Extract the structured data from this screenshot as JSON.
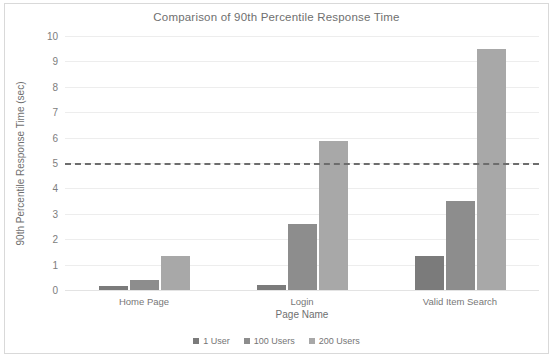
{
  "chart_data": {
    "type": "bar",
    "title": "Comparison of 90th Percentile Response Time",
    "xlabel": "Page Name",
    "ylabel": "90th Percentile Response Time (sec)",
    "categories": [
      "Home Page",
      "Login",
      "Valid Item Search"
    ],
    "series": [
      {
        "name": "1 User",
        "color": "#7b7b7b",
        "values": [
          0.15,
          0.2,
          1.35
        ]
      },
      {
        "name": "100 Users",
        "color": "#8d8d8d",
        "values": [
          0.4,
          2.6,
          3.5
        ]
      },
      {
        "name": "200 Users",
        "color": "#a8a8a8",
        "values": [
          1.35,
          5.85,
          9.5
        ]
      }
    ],
    "ylim": [
      0,
      10
    ],
    "yticks": [
      "0",
      "1",
      "2",
      "3",
      "4",
      "5",
      "6",
      "7",
      "8",
      "9",
      "10"
    ],
    "grid": true,
    "legend_position": "bottom",
    "annotations": [
      {
        "name": "threshold-line",
        "type": "hline",
        "value": 5,
        "style": "dashed",
        "color": "#6d6d6d"
      }
    ]
  },
  "colors": {
    "frame_border": "#d9d9d9",
    "gridline": "#ededed",
    "text": "#6f6f6f",
    "threshold": "#6d6d6d"
  }
}
